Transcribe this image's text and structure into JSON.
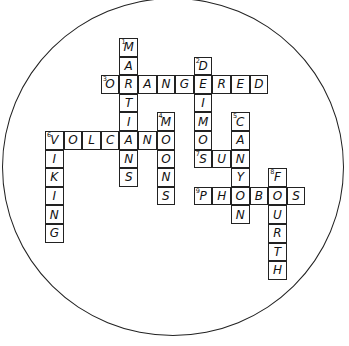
{
  "puzzle": {
    "type": "crossword",
    "state": "solved",
    "cell_size_px": 18.6,
    "origin_px": [
      45,
      38
    ],
    "words": [
      {
        "number": 1,
        "answer": "MARTIANS",
        "direction": "down",
        "row": 0,
        "col": 4
      },
      {
        "number": 2,
        "answer": "DEIMOS",
        "direction": "down",
        "row": 1,
        "col": 8
      },
      {
        "number": 3,
        "answer": "ORANGERED",
        "direction": "across",
        "row": 2,
        "col": 3
      },
      {
        "number": 4,
        "answer": "MOONS",
        "direction": "down",
        "row": 4,
        "col": 6
      },
      {
        "number": 5,
        "answer": "CANYON",
        "direction": "down",
        "row": 4,
        "col": 10
      },
      {
        "number": 6,
        "answer": "VOLCANO",
        "direction": "across",
        "row": 5,
        "col": 0
      },
      {
        "number": 6,
        "answer": "VIKING",
        "direction": "down",
        "row": 5,
        "col": 0
      },
      {
        "number": 7,
        "answer": "SUN",
        "direction": "across",
        "row": 6,
        "col": 8
      },
      {
        "number": 8,
        "answer": "FOURTH",
        "direction": "down",
        "row": 7,
        "col": 12
      },
      {
        "number": 9,
        "answer": "PHOBOS",
        "direction": "across",
        "row": 8,
        "col": 8
      }
    ]
  }
}
